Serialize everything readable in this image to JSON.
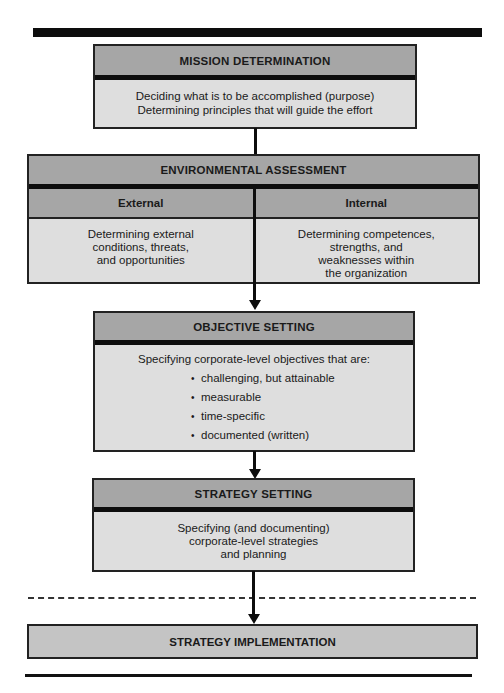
{
  "diagram": {
    "type": "flowchart",
    "orientation": "top-to-bottom",
    "colors": {
      "header_fill": "#a6a6a6",
      "body_fill": "#dedede",
      "implementation_fill": "#c4c4c4",
      "line": "#0d0d0d"
    }
  },
  "mission": {
    "title": "MISSION DETERMINATION",
    "lines": [
      "Deciding what is to be accomplished (purpose)",
      "Determining principles that will guide the effort"
    ]
  },
  "environment": {
    "title": "ENVIRONMENTAL ASSESSMENT",
    "external": {
      "label": "External",
      "lines": [
        "Determining external",
        "conditions, threats,",
        "and opportunities"
      ]
    },
    "internal": {
      "label": "Internal",
      "lines": [
        "Determining competences,",
        "strengths, and",
        "weaknesses within",
        "the organization"
      ]
    }
  },
  "objective": {
    "title": "OBJECTIVE SETTING",
    "intro": "Specifying corporate-level objectives that are:",
    "bullet_glyph": "•",
    "items": [
      "challenging, but attainable",
      "measurable",
      "time-specific",
      "documented (written)"
    ]
  },
  "strategy": {
    "title": "STRATEGY SETTING",
    "lines": [
      "Specifying (and documenting)",
      "corporate-level strategies",
      "and planning"
    ]
  },
  "implementation": {
    "title": "STRATEGY IMPLEMENTATION"
  },
  "connectors": [
    {
      "from": "mission",
      "to": "environment",
      "arrowhead": false
    },
    {
      "from": "environment",
      "to": "objective",
      "arrowhead": true
    },
    {
      "from": "objective",
      "to": "strategy",
      "arrowhead": true
    },
    {
      "from": "strategy",
      "to": "implementation",
      "arrowhead": true,
      "crosses_dashed_line": true
    }
  ]
}
